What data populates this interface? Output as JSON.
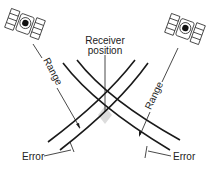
{
  "diagram": {
    "type": "satellite-ranging-geometry",
    "labels": {
      "receiver_line1": "Receiver",
      "receiver_line2": "position",
      "range_left": "Range",
      "range_right": "Range",
      "error_left": "Error",
      "error_right": "Error"
    },
    "icons": {
      "satellite_left": "satellite-icon",
      "satellite_right": "satellite-icon"
    },
    "colors": {
      "line": "#1a1a1a",
      "text": "#222222",
      "shade": "#dcdcdc",
      "background": "#ffffff"
    }
  }
}
